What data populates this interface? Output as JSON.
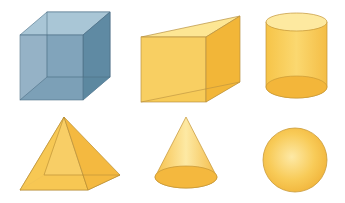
{
  "shapes": [
    {
      "name": "cube",
      "label": "Cube",
      "color": "#6f95ae",
      "row": 1,
      "col": 1
    },
    {
      "name": "triangular-prism",
      "label": "Triangular prism",
      "color": "#f7c84e",
      "row": 1,
      "col": 2
    },
    {
      "name": "cylinder",
      "label": "Cylinder",
      "color": "#f7c84e",
      "row": 1,
      "col": 3
    },
    {
      "name": "square-pyramid",
      "label": "Square pyramid",
      "color": "#f7c84e",
      "row": 2,
      "col": 1
    },
    {
      "name": "cone",
      "label": "Cone",
      "color": "#f7c84e",
      "row": 2,
      "col": 2
    },
    {
      "name": "sphere",
      "label": "Sphere",
      "color": "#f7c84e",
      "row": 2,
      "col": 3
    }
  ],
  "colors": {
    "cube_fill": "#7fa2ba",
    "cube_edge": "#4e6f85",
    "gold_light": "#fde38a",
    "gold_mid": "#f7c84e",
    "gold_dark": "#f0ae2c",
    "gold_edge": "#c9962f"
  }
}
